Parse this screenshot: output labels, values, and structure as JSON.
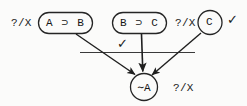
{
  "diagram": {
    "type": "proof-tree-refutation-graph",
    "title": "",
    "nodes": [
      {
        "id": "node-a-imp-b",
        "label": "A ⊃ B",
        "shape": "rounded-rect",
        "annotation": "?/X",
        "annotation_side": "left"
      },
      {
        "id": "node-b-imp-c",
        "label": "B ⊃ C",
        "shape": "rounded-rect",
        "annotation": "",
        "annotation_side": ""
      },
      {
        "id": "node-c",
        "label": "C",
        "shape": "circle",
        "annotation": "?/X",
        "annotation_side": "left"
      },
      {
        "id": "node-not-a",
        "label": "∼A",
        "shape": "circle",
        "annotation": "?/X",
        "annotation_side": "right"
      }
    ],
    "marks": [
      {
        "id": "check-middle",
        "glyph": "✓"
      },
      {
        "id": "check-right",
        "glyph": "✓"
      }
    ],
    "edges": [
      {
        "from": "node-a-imp-b",
        "to": "node-not-a",
        "arrow": true
      },
      {
        "from": "node-b-imp-c",
        "to": "node-not-a",
        "arrow": true
      },
      {
        "from": "node-c",
        "to": "node-not-a",
        "arrow": true
      }
    ],
    "separator": {
      "id": "horizontal-rule",
      "orientation": "horizontal"
    },
    "colors": {
      "ink": "#1a1a1a",
      "background": "#fbfbfa",
      "stroke": "#2a2a2a"
    }
  }
}
